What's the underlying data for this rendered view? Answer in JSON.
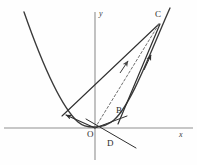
{
  "figure": {
    "background_color": "#fefefe",
    "curve_color": "#3a3a3a",
    "axis_color": "#8c8c8c",
    "vector_color": "#2f2f2f",
    "dashed_color": "#6e6e6e",
    "label_color": "#2b2b2b"
  },
  "axes": {
    "x_label": "x",
    "y_label": "y",
    "origin_label": "O",
    "x_axis": {
      "x1": 4,
      "y1": 128,
      "x2": 193,
      "y2": 128
    },
    "y_axis": {
      "x1": 95,
      "y1": 12,
      "x2": 95,
      "y2": 160
    }
  },
  "points": [
    {
      "name": "O",
      "label": "O",
      "x": 95,
      "y": 128,
      "label_x": 88,
      "label_y": 130
    },
    {
      "name": "B",
      "label": "B",
      "x": 123,
      "y": 119,
      "label_x": 115,
      "label_y": 107
    },
    {
      "name": "C",
      "label": "C",
      "x": 160,
      "y": 22,
      "label_x": 156,
      "label_y": 11
    },
    {
      "name": "D",
      "label": "D",
      "x": 105,
      "y": 140,
      "label_x": 107,
      "label_y": 138
    },
    {
      "name": "A",
      "label": "",
      "x": 62,
      "y": 116,
      "label_x": 54,
      "label_y": 104
    }
  ],
  "curve": {
    "type": "parabola",
    "description": "upward opening parabola with vertex at origin",
    "path": "M 24 12 C 38 52, 58 104, 78 122 C 86 129, 104 129, 114 120 C 132 104, 152 48, 170 8"
  },
  "segments": [
    {
      "name": "vector-oa",
      "from": "O",
      "to": "A",
      "style": "solid",
      "arrow": true,
      "path": "M 95 128 L 64 114"
    },
    {
      "name": "vector-oc-dashed",
      "from": "O",
      "to": "C",
      "style": "dashed",
      "arrow": true,
      "path": "M 95 128 L 158 24"
    },
    {
      "name": "vector-bc",
      "from": "B",
      "to": "C",
      "style": "solid",
      "arrow": true,
      "path": "M 119 123 L 159 25"
    },
    {
      "name": "chord-ac",
      "from": "A",
      "to": "C",
      "style": "solid",
      "arrow": false,
      "path": "M 62 116 L 159 24"
    },
    {
      "name": "line-through-o-d",
      "from": "B-side",
      "to": "D",
      "style": "solid",
      "arrow": false,
      "path": "M 88 120 L 133 146"
    }
  ],
  "arrowheads": [
    {
      "name": "arrowhead-oa",
      "x": 63,
      "y": 115,
      "angle": 205
    },
    {
      "name": "arrowhead-oc",
      "x": 127,
      "y": 66,
      "angle": -59
    },
    {
      "name": "arrowhead-bc",
      "x": 150,
      "y": 57,
      "angle": -68
    }
  ]
}
